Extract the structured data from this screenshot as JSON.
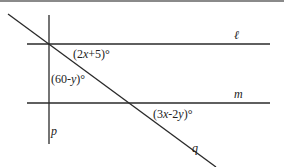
{
  "diagram": {
    "lines": [
      {
        "name": "l",
        "label": "ℓ"
      },
      {
        "name": "m",
        "label": "m"
      },
      {
        "name": "p",
        "label": "p"
      },
      {
        "name": "q",
        "label": "q"
      }
    ],
    "angles": [
      {
        "label": "(2x+5)°",
        "pre": "(2",
        "var1": "x",
        "post": "+5)°"
      },
      {
        "label": "(60-y)°",
        "pre": "(60-",
        "var1": "y",
        "post": ")°"
      },
      {
        "label": "(3x-2y)°",
        "pre": "(3",
        "var1": "x",
        "mid": "-2",
        "var2": "y",
        "post": ")°"
      }
    ],
    "colors": {
      "line": "#2a2a2a",
      "border": "#8a8a8a"
    }
  }
}
